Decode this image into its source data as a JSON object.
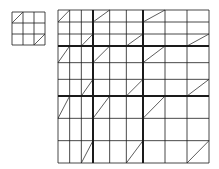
{
  "diagram": {
    "line_color": "#1a1a1a",
    "thin_line_width": 0.8,
    "thick_line_width": 2,
    "diagonal_color": "#333333",
    "small_grid": {
      "x": 12,
      "y": 12,
      "col_widths": [
        11,
        11,
        11
      ],
      "row_heights": [
        11,
        11,
        11
      ],
      "diagonal_cells": [
        [
          0,
          0
        ],
        [
          2,
          2
        ]
      ]
    },
    "large_grid": {
      "x": 58,
      "y": 10,
      "block_widths": [
        35,
        50,
        66
      ],
      "block_heights": [
        36,
        50,
        67
      ],
      "sub_divisions": 3,
      "diagonal_sub_cells": [
        [
          0,
          0
        ],
        [
          2,
          2
        ]
      ]
    }
  }
}
